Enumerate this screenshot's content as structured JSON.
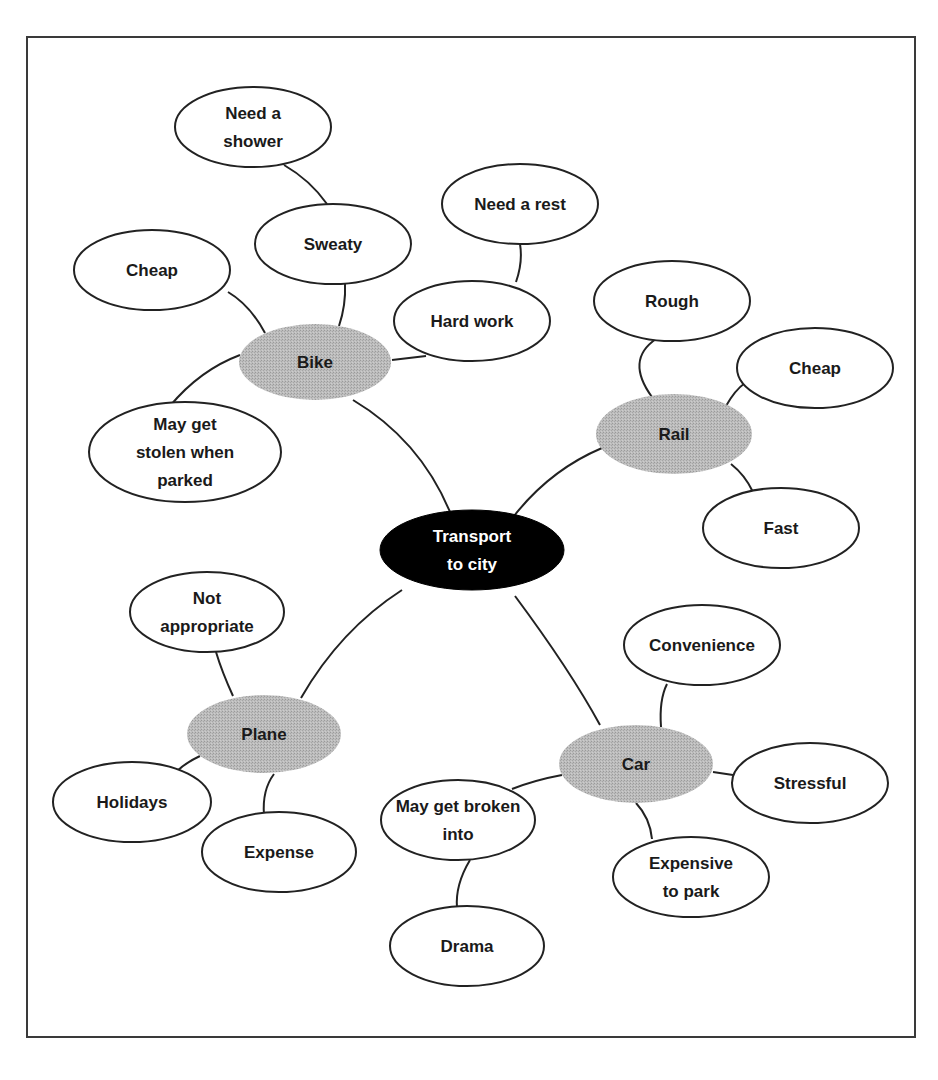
{
  "diagram": {
    "type": "mind-map",
    "colors": {
      "central_fill": "#000000",
      "central_text": "#ffffff",
      "branch_fill": "#b4b4b4",
      "leaf_fill": "#ffffff",
      "stroke": "#222222",
      "text": "#1a1a1a"
    },
    "central": {
      "id": "central",
      "lines": [
        "Transport",
        "to city"
      ]
    },
    "branches": [
      {
        "id": "bike",
        "lines": [
          "Bike"
        ],
        "children": [
          {
            "id": "bike-cheap",
            "lines": [
              "Cheap"
            ]
          },
          {
            "id": "bike-sweaty",
            "lines": [
              "Sweaty"
            ],
            "children": [
              {
                "id": "bike-shower",
                "lines": [
                  "Need a",
                  "shower"
                ]
              }
            ]
          },
          {
            "id": "bike-hardwork",
            "lines": [
              "Hard work"
            ],
            "children": [
              {
                "id": "bike-rest",
                "lines": [
                  "Need a rest"
                ]
              }
            ]
          },
          {
            "id": "bike-stolen",
            "lines": [
              "May get",
              "stolen when",
              "parked"
            ]
          }
        ]
      },
      {
        "id": "rail",
        "lines": [
          "Rail"
        ],
        "children": [
          {
            "id": "rail-rough",
            "lines": [
              "Rough"
            ]
          },
          {
            "id": "rail-cheap",
            "lines": [
              "Cheap"
            ]
          },
          {
            "id": "rail-fast",
            "lines": [
              "Fast"
            ]
          }
        ]
      },
      {
        "id": "plane",
        "lines": [
          "Plane"
        ],
        "children": [
          {
            "id": "plane-notappropriate",
            "lines": [
              "Not",
              "appropriate"
            ]
          },
          {
            "id": "plane-holidays",
            "lines": [
              "Holidays"
            ]
          },
          {
            "id": "plane-expense",
            "lines": [
              "Expense"
            ]
          }
        ]
      },
      {
        "id": "car",
        "lines": [
          "Car"
        ],
        "children": [
          {
            "id": "car-convenience",
            "lines": [
              "Convenience"
            ]
          },
          {
            "id": "car-stressful",
            "lines": [
              "Stressful"
            ]
          },
          {
            "id": "car-expensive-park",
            "lines": [
              "Expensive",
              "to park"
            ]
          },
          {
            "id": "car-brokeninto",
            "lines": [
              "May get broken",
              "into"
            ],
            "children": [
              {
                "id": "car-drama",
                "lines": [
                  "Drama"
                ]
              }
            ]
          }
        ]
      }
    ]
  }
}
